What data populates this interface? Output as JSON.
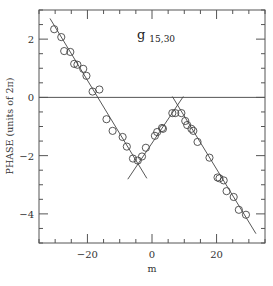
{
  "chart_data": {
    "type": "scatter",
    "title": "g",
    "title_subscript": "15,30",
    "xlabel": "m",
    "ylabel": "PHASE (units of 2π)",
    "xlim": [
      -35,
      35
    ],
    "ylim": [
      -5,
      3
    ],
    "x_ticks_major": [
      -20,
      0,
      20
    ],
    "x_tick_labels": [
      "−20",
      "0",
      "20"
    ],
    "y_ticks_major": [
      -4,
      -2,
      0,
      2
    ],
    "y_tick_labels": [
      "−4",
      "−2",
      "0",
      "2"
    ],
    "x_minor_step": 5,
    "y_minor_step": 0.5,
    "grid": false,
    "reference_line_y": 0,
    "marker": "open-circle",
    "series": [
      {
        "name": "measured phase",
        "points": [
          [
            -30.3,
            2.34
          ],
          [
            -28.1,
            2.07
          ],
          [
            -27.2,
            1.59
          ],
          [
            -25.3,
            1.56
          ],
          [
            -24.1,
            1.15
          ],
          [
            -23.1,
            1.12
          ],
          [
            -21.3,
            0.98
          ],
          [
            -20.3,
            0.74
          ],
          [
            -18.4,
            0.2
          ],
          [
            -16.3,
            0.27
          ],
          [
            -14.1,
            -0.75
          ],
          [
            -12.2,
            -1.15
          ],
          [
            -9.1,
            -1.36
          ],
          [
            -7.8,
            -1.69
          ],
          [
            -5.9,
            -2.1
          ],
          [
            -4.4,
            -2.17
          ],
          [
            -3.1,
            -2.03
          ],
          [
            -1.9,
            -1.73
          ],
          [
            0.9,
            -1.32
          ],
          [
            1.6,
            -1.19
          ],
          [
            3.1,
            -1.05
          ],
          [
            3.4,
            -1.08
          ],
          [
            6.3,
            -0.54
          ],
          [
            7.2,
            -0.54
          ],
          [
            9.1,
            -0.54
          ],
          [
            10.3,
            -0.81
          ],
          [
            10.9,
            -0.95
          ],
          [
            12.2,
            -1.08
          ],
          [
            12.8,
            -1.15
          ],
          [
            14.1,
            -1.53
          ],
          [
            17.8,
            -2.07
          ],
          [
            20.3,
            -2.75
          ],
          [
            20.9,
            -2.78
          ],
          [
            22.2,
            -2.85
          ],
          [
            23.1,
            -3.22
          ],
          [
            25.3,
            -3.42
          ],
          [
            26.9,
            -3.86
          ],
          [
            29.1,
            -4.03
          ]
        ]
      }
    ],
    "fit_lines": [
      {
        "name": "fit-1",
        "from": [
          -31.6,
          2.71
        ],
        "to": [
          -1.6,
          -2.78
        ]
      },
      {
        "name": "fit-2",
        "from": [
          -7.5,
          -2.81
        ],
        "to": [
          9.7,
          0.03
        ]
      },
      {
        "name": "fit-3",
        "from": [
          6.3,
          0.03
        ],
        "to": [
          32.2,
          -4.68
        ]
      }
    ],
    "colors": {
      "axes": "#555555",
      "points": "#444444",
      "lines": "#444444",
      "text": "#333333"
    }
  }
}
